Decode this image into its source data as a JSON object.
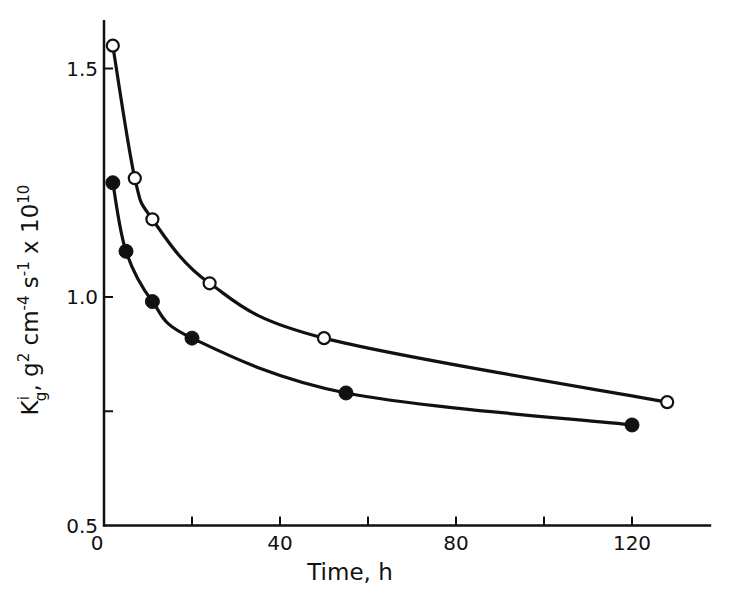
{
  "chart_data": {
    "type": "line",
    "title": "",
    "xlabel": "Time, h",
    "ylabel": "K_g^i, g^2 cm^-4 s^-1 x 10^10",
    "xlim": [
      0,
      138
    ],
    "ylim": [
      0.5,
      1.6
    ],
    "grid": false,
    "legend": null,
    "x_ticks": [
      0,
      20,
      40,
      60,
      80,
      100,
      120
    ],
    "x_tick_labels": [
      "0",
      "",
      "40",
      "",
      "80",
      "",
      "120"
    ],
    "y_ticks": [
      0.5,
      0.75,
      1.0,
      1.5
    ],
    "y_tick_labels": [
      "0.5",
      "",
      "1.0",
      "1.5"
    ],
    "series": [
      {
        "name": "open circles",
        "marker": "open-circle",
        "x": [
          2,
          7,
          11,
          24,
          50,
          128
        ],
        "values": [
          1.55,
          1.26,
          1.17,
          1.03,
          0.91,
          0.77
        ]
      },
      {
        "name": "filled circles",
        "marker": "filled-circle",
        "x": [
          2,
          5,
          11,
          20,
          55,
          120
        ],
        "values": [
          1.25,
          1.1,
          0.99,
          0.91,
          0.79,
          0.72
        ]
      }
    ]
  },
  "labels": {
    "xlabel": "Time, h",
    "ylabel_main": "K",
    "ylabel_sup_i": "i",
    "ylabel_sub_g": "g",
    "ylabel_rest1": ", g",
    "ylabel_sup_2": "2",
    "ylabel_rest2": " cm",
    "ylabel_sup_m4": "-4",
    "ylabel_rest3": " s",
    "ylabel_sup_m1": "-1",
    "ylabel_rest4": " x 10",
    "ylabel_sup_10": "10"
  }
}
